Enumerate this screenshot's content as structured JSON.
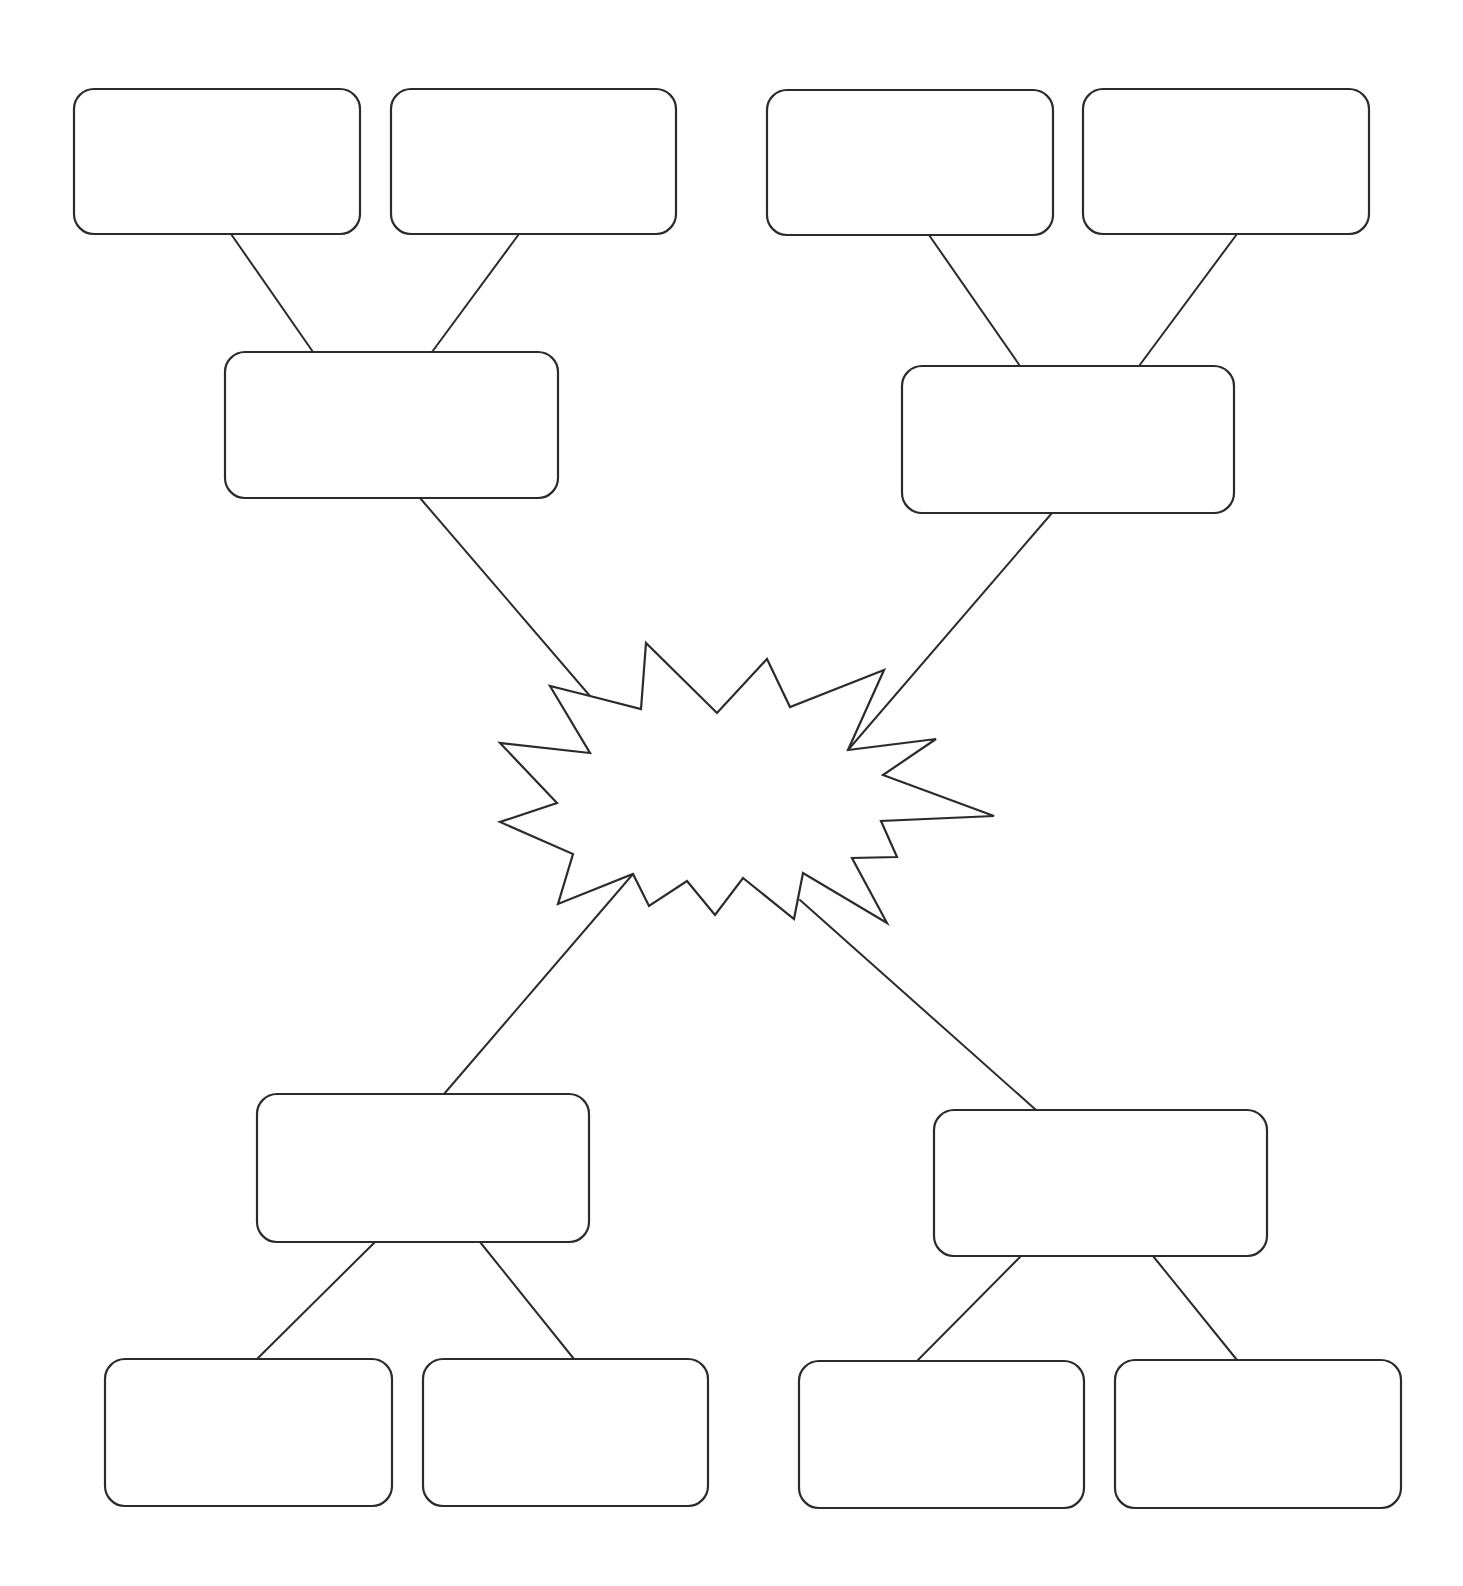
{
  "diagram": {
    "title": "",
    "type": "blank graphic organizer (central burst with four branching clusters)",
    "canvas": {
      "width": 1463,
      "height": 1586,
      "background": "#ffffff"
    },
    "colors": {
      "stroke": "#2b2b2b",
      "fill": "#ffffff"
    },
    "center": {
      "id": "center-burst",
      "label": "",
      "points": [
        [
          590,
          696
        ],
        [
          550,
          686
        ],
        [
          590,
          753
        ],
        [
          500,
          743
        ],
        [
          557,
          803
        ],
        [
          500,
          822
        ],
        [
          573,
          854
        ],
        [
          558,
          904
        ],
        [
          633,
          874
        ],
        [
          649,
          906
        ],
        [
          687,
          881
        ],
        [
          715,
          915
        ],
        [
          743,
          878
        ],
        [
          794,
          919
        ],
        [
          803,
          873
        ],
        [
          887,
          923
        ],
        [
          852,
          858
        ],
        [
          897,
          857
        ],
        [
          881,
          821
        ],
        [
          994,
          816
        ],
        [
          883,
          775
        ],
        [
          936,
          739
        ],
        [
          848,
          750
        ],
        [
          884,
          670
        ],
        [
          790,
          707
        ],
        [
          767,
          659
        ],
        [
          717,
          713
        ],
        [
          646,
          643
        ],
        [
          641,
          709
        ]
      ]
    },
    "nodes": [
      {
        "id": "top-left-leaf-1",
        "label": "",
        "x": 74,
        "y": 89,
        "w": 286,
        "h": 145
      },
      {
        "id": "top-left-leaf-2",
        "label": "",
        "x": 391,
        "y": 89,
        "w": 285,
        "h": 145
      },
      {
        "id": "top-right-leaf-1",
        "label": "",
        "x": 767,
        "y": 90,
        "w": 286,
        "h": 145
      },
      {
        "id": "top-right-leaf-2",
        "label": "",
        "x": 1083,
        "y": 89,
        "w": 286,
        "h": 145
      },
      {
        "id": "top-left-branch",
        "label": "",
        "x": 225,
        "y": 352,
        "w": 333,
        "h": 146
      },
      {
        "id": "top-right-branch",
        "label": "",
        "x": 902,
        "y": 366,
        "w": 332,
        "h": 147
      },
      {
        "id": "bottom-left-branch",
        "label": "",
        "x": 257,
        "y": 1094,
        "w": 332,
        "h": 148
      },
      {
        "id": "bottom-right-branch",
        "label": "",
        "x": 934,
        "y": 1110,
        "w": 333,
        "h": 146
      },
      {
        "id": "bottom-left-leaf-1",
        "label": "",
        "x": 105,
        "y": 1359,
        "w": 287,
        "h": 147
      },
      {
        "id": "bottom-left-leaf-2",
        "label": "",
        "x": 423,
        "y": 1359,
        "w": 285,
        "h": 147
      },
      {
        "id": "bottom-right-leaf-1",
        "label": "",
        "x": 799,
        "y": 1361,
        "w": 285,
        "h": 147
      },
      {
        "id": "bottom-right-leaf-2",
        "label": "",
        "x": 1115,
        "y": 1360,
        "w": 286,
        "h": 148
      }
    ],
    "corner_radius": 20,
    "connectors": [
      {
        "id": "tl-leaf1-to-branch",
        "x1": 231,
        "y1": 234,
        "x2": 313,
        "y2": 352
      },
      {
        "id": "tl-leaf2-to-branch",
        "x1": 519,
        "y1": 234,
        "x2": 432,
        "y2": 352
      },
      {
        "id": "tr-leaf1-to-branch",
        "x1": 929,
        "y1": 235,
        "x2": 1020,
        "y2": 366
      },
      {
        "id": "tr-leaf2-to-branch",
        "x1": 1237,
        "y1": 234,
        "x2": 1139,
        "y2": 366
      },
      {
        "id": "tl-branch-to-center",
        "x1": 420,
        "y1": 498,
        "x2": 590,
        "y2": 696
      },
      {
        "id": "tr-branch-to-center",
        "x1": 1052,
        "y1": 513,
        "x2": 848,
        "y2": 750
      },
      {
        "id": "center-to-bl-branch",
        "x1": 633,
        "y1": 874,
        "x2": 444,
        "y2": 1094
      },
      {
        "id": "center-to-br-branch",
        "x1": 800,
        "y1": 900,
        "x2": 1036,
        "y2": 1110
      },
      {
        "id": "bl-branch-to-leaf1",
        "x1": 375,
        "y1": 1242,
        "x2": 257,
        "y2": 1359
      },
      {
        "id": "bl-branch-to-leaf2",
        "x1": 480,
        "y1": 1242,
        "x2": 574,
        "y2": 1359
      },
      {
        "id": "br-branch-to-leaf1",
        "x1": 1021,
        "y1": 1256,
        "x2": 917,
        "y2": 1361
      },
      {
        "id": "br-branch-to-leaf2",
        "x1": 1153,
        "y1": 1256,
        "x2": 1237,
        "y2": 1360
      }
    ]
  }
}
